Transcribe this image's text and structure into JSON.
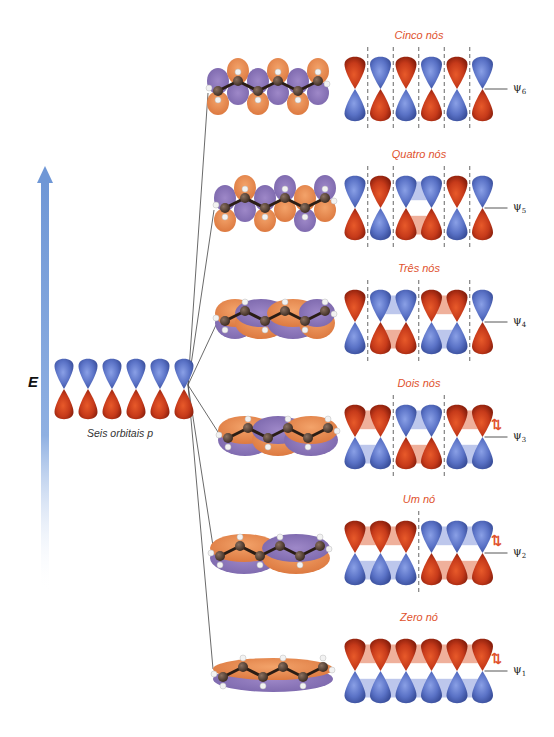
{
  "axis": {
    "energy_label": "E",
    "colors": {
      "arrow_top": "#6f97d6",
      "arrow_bottom": "#ffffff"
    }
  },
  "basis": {
    "label": "Seis orbitais p",
    "count": 6,
    "center": [
      120,
      389
    ]
  },
  "colors": {
    "positive_lobe": "#c63a1a",
    "negative_lobe": "#5a72c6",
    "node_label": "#e0522e",
    "mo_orange": "#e8874a",
    "mo_purple": "#8a74b6",
    "line": "#333333"
  },
  "levels": [
    {
      "id": "psi6",
      "psi_label": "ψ",
      "psi_sub": "6",
      "nodes_label": "Cinco nós",
      "y": 75,
      "top_signs": [
        "+",
        "-",
        "+",
        "-",
        "+",
        "-"
      ],
      "nodes_after": [
        0,
        1,
        2,
        3,
        4
      ],
      "electrons": false,
      "line_end": [
        208,
        93
      ]
    },
    {
      "id": "psi5",
      "psi_label": "ψ",
      "psi_sub": "5",
      "nodes_label": "Quatro nós",
      "y": 194,
      "top_signs": [
        "-",
        "+",
        "-",
        "-",
        "+",
        "-"
      ],
      "nodes_after": [
        0,
        1,
        3,
        4
      ],
      "electrons": false,
      "line_end": [
        214,
        210
      ]
    },
    {
      "id": "psi4",
      "psi_label": "ψ",
      "psi_sub": "4",
      "nodes_label": "Três nós",
      "y": 308,
      "top_signs": [
        "+",
        "-",
        "-",
        "+",
        "+",
        "-"
      ],
      "nodes_after": [
        0,
        2,
        4
      ],
      "electrons": false,
      "line_end": [
        216,
        325
      ]
    },
    {
      "id": "psi3",
      "psi_label": "ψ",
      "psi_sub": "3",
      "nodes_label": "Dois nós",
      "y": 423,
      "top_signs": [
        "+",
        "+",
        "-",
        "-",
        "+",
        "+"
      ],
      "nodes_after": [
        1,
        3
      ],
      "electrons": true,
      "line_end": [
        218,
        432
      ]
    },
    {
      "id": "psi2",
      "psi_label": "ψ",
      "psi_sub": "2",
      "nodes_label": "Um nó",
      "y": 539,
      "top_signs": [
        "+",
        "+",
        "+",
        "-",
        "-",
        "-"
      ],
      "nodes_after": [
        2
      ],
      "electrons": true,
      "line_end": [
        213,
        546
      ]
    },
    {
      "id": "psi1",
      "psi_label": "ψ",
      "psi_sub": "1",
      "nodes_label": "Zero nó",
      "y": 657,
      "top_signs": [
        "+",
        "+",
        "+",
        "+",
        "+",
        "+"
      ],
      "nodes_after": [],
      "electrons": true,
      "line_end": [
        213,
        669
      ]
    }
  ],
  "electron_pair_glyph": "⇅",
  "fan_origin": [
    188,
    385
  ]
}
